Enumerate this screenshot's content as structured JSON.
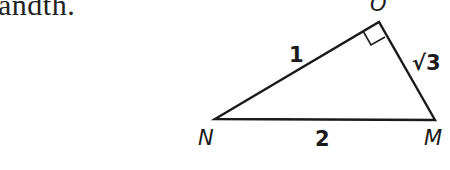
{
  "prose": {
    "text": "andth."
  },
  "diagram": {
    "type": "right-triangle",
    "vertices": {
      "O": {
        "label": "O",
        "x": 379,
        "y": 22
      },
      "N": {
        "label": "N",
        "x": 215,
        "y": 119
      },
      "M": {
        "label": "M",
        "x": 435,
        "y": 120
      }
    },
    "right_angle_at": "O",
    "sides": {
      "NO": {
        "label": "1"
      },
      "OM": {
        "label": "√3"
      },
      "NM": {
        "label": "2"
      }
    },
    "stroke_color": "#1a1a1a"
  }
}
